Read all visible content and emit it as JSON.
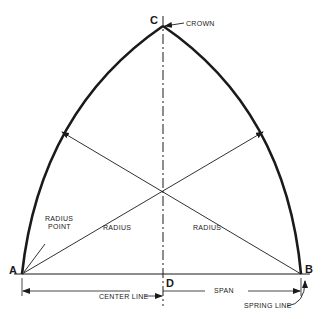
{
  "diagram": {
    "points": {
      "a": "A",
      "b": "B",
      "c": "C",
      "d": "D"
    },
    "labels": {
      "crown": "CROWN",
      "radius_point_line1": "RADIUS",
      "radius_point_line2": "POINT",
      "radius_left": "RADIUS",
      "radius_right": "RADIUS",
      "center_line": "CENTER LINE",
      "span": "SPAN",
      "spring_line": "SPRING LINE"
    },
    "colors": {
      "ink": "#1a1a1a",
      "background": "#ffffff"
    }
  }
}
